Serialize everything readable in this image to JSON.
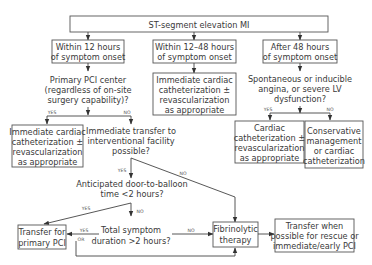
{
  "diagram": {
    "title": "ST-segment elevation MI",
    "branches": {
      "within_12": {
        "label": [
          "Within 12 hours",
          "of symptom onset"
        ]
      },
      "within_12_48": {
        "label": [
          "Within 12–48 hours",
          "of symptom onset"
        ]
      },
      "after_48": {
        "label": [
          "After 48 hours",
          "of symptom onset"
        ]
      }
    },
    "nodes": {
      "primary_pci_center": [
        "Primary PCI center",
        "(regardless of on-site",
        "surgery capability)?"
      ],
      "immediate_cath_left": [
        "Immediate cardiac",
        "catheterization ±",
        "revascularization",
        "as appropriate"
      ],
      "immediate_cath_middle": [
        "Immediate cardiac",
        "catheterization ±",
        "revascularization",
        "as appropriate"
      ],
      "immediate_transfer": [
        "Immediate transfer to",
        "interventional facility",
        "possible?"
      ],
      "door_to_balloon": [
        "Anticipated door-to-balloon",
        "time <2 hours?"
      ],
      "transfer_primary_pci": [
        "Transfer for",
        "primary PCI"
      ],
      "total_symptom_duration": [
        "Total symptom",
        "duration >2 hours?"
      ],
      "fibrinolytic": [
        "Fibrinolytic",
        "therapy"
      ],
      "transfer_rescue": [
        "Transfer when",
        "possible for rescue or",
        "immediate/early PCI"
      ],
      "spontaneous_angina": [
        "Spontaneous or inducible",
        "angina, or severe LV",
        "dysfunction?"
      ],
      "cardiac_cath_right": [
        "Cardiac",
        "catheterization ±",
        "revascularization",
        "as appropriate"
      ],
      "conservative": [
        "Conservative",
        "management",
        "or cardiac",
        "catheterization"
      ]
    },
    "edge_labels": {
      "yes": "YES",
      "no": "NO",
      "or": "OR"
    }
  }
}
